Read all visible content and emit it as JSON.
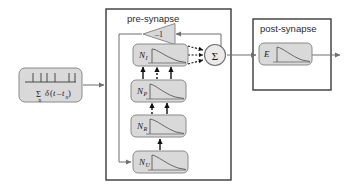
{
  "figure": {
    "kind": "block-diagram",
    "background_color": "#ffffff",
    "line_color": "#6f6f6f",
    "dark_line_color": "#1a1a1a",
    "block_fill": "#d9d9d9",
    "block_stroke": "#8a8a8a",
    "container_stroke": "#3a3a3a"
  },
  "groups": {
    "pre_synapse": {
      "label": "pre-synapse"
    },
    "post_synapse": {
      "label": "post-synapse"
    }
  },
  "input_block": {
    "name": "spike-train-input",
    "equation_sum": "Σ",
    "equation_sum_index": "n",
    "equation_delta": "δ",
    "equation_arg_open": "(",
    "equation_arg_t": "t",
    "equation_arg_minus": "–",
    "equation_arg_t2": "t",
    "equation_arg_sub": "n",
    "equation_arg_close": ")",
    "equation_full": "Σₙ δ(t – tₙ)",
    "spike_positions": [
      14,
      22,
      28,
      36,
      50,
      56
    ],
    "description": "input spike train"
  },
  "gain_block": {
    "name": "inverting-gain",
    "label": "–1",
    "orientation": "left-pointing-triangle"
  },
  "sum_block": {
    "name": "summation-node",
    "label": "Σ",
    "input_count": 3
  },
  "pre_blocks": [
    {
      "id": "N_I",
      "letter": "N",
      "subscript": "I",
      "curve": "exp-decay"
    },
    {
      "id": "N_P",
      "letter": "N",
      "subscript": "P",
      "curve": "exp-decay"
    },
    {
      "id": "N_R",
      "letter": "N",
      "subscript": "R",
      "curve": "exp-decay"
    },
    {
      "id": "N_U",
      "letter": "N",
      "subscript": "U",
      "curve": "exp-decay"
    }
  ],
  "post_blocks": [
    {
      "id": "E",
      "letter": "E",
      "subscript": "",
      "curve": "exp-decay"
    }
  ],
  "connections": [
    {
      "from": "spike-train-input",
      "to": "pre-synapse",
      "style": "solid"
    },
    {
      "from": "N_U",
      "to": "N_R",
      "style": "solid"
    },
    {
      "from": "N_R",
      "to": "N_P",
      "style": "solid"
    },
    {
      "from": "N_R",
      "to": "N_P",
      "style": "dashed"
    },
    {
      "from": "N_P",
      "to": "N_I",
      "style": "solid"
    },
    {
      "from": "N_P",
      "to": "N_I",
      "style": "dashed"
    },
    {
      "from": "N_I",
      "to": "summation-node",
      "style": "dashed"
    },
    {
      "from": "summation-node",
      "to": "inverting-gain",
      "style": "solid"
    },
    {
      "from": "inverting-gain",
      "to": "N_U",
      "style": "solid"
    },
    {
      "from": "summation-node",
      "to": "E",
      "style": "solid"
    },
    {
      "from": "E",
      "to": "output",
      "style": "solid"
    }
  ]
}
